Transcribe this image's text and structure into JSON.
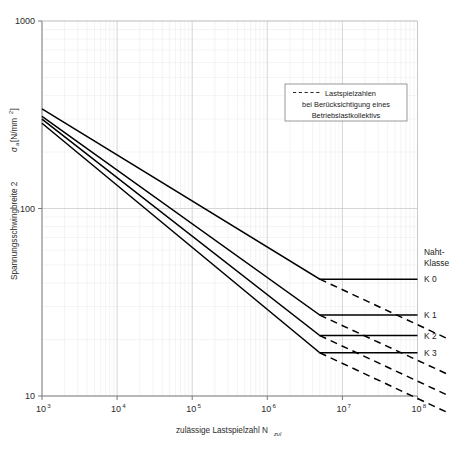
{
  "chart_data": {
    "type": "line",
    "title": "",
    "xlabel": "zulässige Lastspielzahl N",
    "xlabel_sub": "zul",
    "ylabel": "Spannungsschwingbreite 2",
    "ylabel_sigma": "σ",
    "ylabel_sub": "a",
    "ylabel_unit": "[N/mm",
    "ylabel_unit_sup": "2",
    "ylabel_unit_end": "]",
    "xscale": "log",
    "yscale": "log",
    "xlim": [
      1000,
      100000000
    ],
    "ylim": [
      10,
      1000
    ],
    "grid": true,
    "xticks": [
      {
        "value": 1000,
        "mantissa": "10",
        "exponent": "3"
      },
      {
        "value": 10000,
        "mantissa": "10",
        "exponent": "4"
      },
      {
        "value": 100000,
        "mantissa": "10",
        "exponent": "5"
      },
      {
        "value": 1000000,
        "mantissa": "10",
        "exponent": "6"
      },
      {
        "value": 10000000,
        "mantissa": "10",
        "exponent": "7"
      },
      {
        "value": 100000000,
        "mantissa": "10",
        "exponent": "8"
      }
    ],
    "yticks": [
      {
        "value": 10,
        "label": "10"
      },
      {
        "value": 100,
        "label": "100"
      },
      {
        "value": 1000,
        "label": "1000"
      }
    ],
    "series": [
      {
        "name": "K 0",
        "label": "K 0",
        "style": "solid",
        "points": [
          {
            "x": 1000,
            "y": 340
          },
          {
            "x": 5000000,
            "y": 42
          },
          {
            "x": 100000000,
            "y": 42
          }
        ],
        "cutoff_x": 5000000,
        "cutoff_y": 42,
        "dashed_points": [
          {
            "x": 5000000,
            "y": 42
          },
          {
            "x": 100000000,
            "y": 24
          }
        ]
      },
      {
        "name": "K 1",
        "label": "K 1",
        "style": "solid",
        "points": [
          {
            "x": 1000,
            "y": 310
          },
          {
            "x": 5000000,
            "y": 27
          },
          {
            "x": 100000000,
            "y": 27
          }
        ],
        "cutoff_x": 5000000,
        "cutoff_y": 27,
        "dashed_points": [
          {
            "x": 5000000,
            "y": 27
          },
          {
            "x": 100000000,
            "y": 15.5
          }
        ]
      },
      {
        "name": "K 2",
        "label": "K 2",
        "style": "solid",
        "points": [
          {
            "x": 1000,
            "y": 300
          },
          {
            "x": 5000000,
            "y": 21
          },
          {
            "x": 100000000,
            "y": 21
          }
        ],
        "cutoff_x": 5000000,
        "cutoff_y": 21,
        "dashed_points": [
          {
            "x": 5000000,
            "y": 21
          },
          {
            "x": 100000000,
            "y": 12
          }
        ]
      },
      {
        "name": "K 3",
        "label": "K 3",
        "style": "solid",
        "points": [
          {
            "x": 1000,
            "y": 285
          },
          {
            "x": 5000000,
            "y": 17
          },
          {
            "x": 100000000,
            "y": 17
          }
        ],
        "cutoff_x": 5000000,
        "cutoff_y": 17,
        "dashed_points": [
          {
            "x": 5000000,
            "y": 17
          },
          {
            "x": 100000000,
            "y": 9.7
          }
        ]
      }
    ]
  },
  "legend": {
    "line1": "Lastspielzahlen",
    "line2": "bei Berücksichtigung eines",
    "line3": "Betriebslastkollektivs",
    "sample_style": "dashed"
  },
  "class_header": {
    "line1": "Naht-",
    "line2": "Klasse"
  },
  "class_labels": [
    {
      "label": "K 0"
    },
    {
      "label": "K 1"
    },
    {
      "label": "K 2"
    },
    {
      "label": "K 3"
    }
  ],
  "colors": {
    "curve": "#000000",
    "grid_major": "#c8c8c8",
    "grid_minor": "#e6e6e6",
    "axis": "#808080",
    "text": "#1a1a1a",
    "background": "#ffffff"
  }
}
